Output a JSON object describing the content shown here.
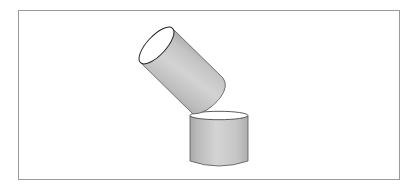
{
  "figure": {
    "frame": {
      "border_color": "#9a9a9a"
    },
    "colors": {
      "body_fill": "#c8c8c8",
      "body_shade_dark": "#a9a9a9",
      "body_highlight": "#d6d6d6",
      "top_face": "#ffffff",
      "outline": "#333333"
    },
    "shapes": [
      {
        "name": "tilted-cylinder",
        "orientation": "tilted ~55°"
      },
      {
        "name": "upright-cylinder",
        "orientation": "vertical"
      }
    ]
  }
}
